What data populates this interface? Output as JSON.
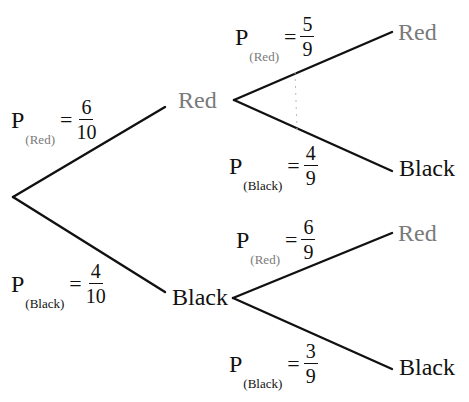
{
  "diagram": {
    "type": "probability-tree",
    "colors": {
      "red_label": "#7a7a7a",
      "black_label": "#111111",
      "lines": "#111111"
    },
    "level1": {
      "red": {
        "node_label": "Red",
        "prob_letter": "P",
        "prob_subscript": "(Red)",
        "equals": "=",
        "numerator": "6",
        "denominator": "10"
      },
      "black": {
        "node_label": "Black",
        "prob_letter": "P",
        "prob_subscript": "(Black)",
        "equals": "=",
        "numerator": "4",
        "denominator": "10"
      }
    },
    "level2": {
      "after_red": {
        "red": {
          "node_label": "Red",
          "prob_letter": "P",
          "prob_subscript": "(Red)",
          "equals": "=",
          "numerator": "5",
          "denominator": "9"
        },
        "black": {
          "node_label": "Black",
          "prob_letter": "P",
          "prob_subscript": "(Black)",
          "equals": "=",
          "numerator": "4",
          "denominator": "9"
        }
      },
      "after_black": {
        "red": {
          "node_label": "Red",
          "prob_letter": "P",
          "prob_subscript": "(Red)",
          "equals": "=",
          "numerator": "6",
          "denominator": "9"
        },
        "black": {
          "node_label": "Black",
          "prob_letter": "P",
          "prob_subscript": "(Black)",
          "equals": "=",
          "numerator": "3",
          "denominator": "9"
        }
      }
    }
  }
}
